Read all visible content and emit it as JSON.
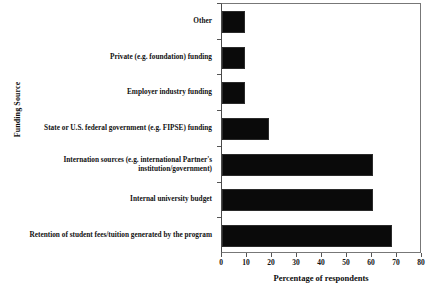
{
  "chart_data": {
    "type": "bar",
    "orientation": "horizontal",
    "title": "",
    "xlabel": "Percentage of respondents",
    "ylabel": "Funding Source",
    "xlim": [
      0,
      80
    ],
    "xticks": [
      0,
      10,
      20,
      30,
      40,
      50,
      60,
      70,
      80
    ],
    "grid": false,
    "legend": null,
    "bar_color": "#0a0a0a",
    "categories": [
      "Other",
      "Private (e.g. foundation) funding",
      "Employer industry funding",
      "State or U.S. federal government (e.g. FIPSE) funding",
      "Internation sources (e.g. international Partner's institution/government)",
      "Internal university budget",
      "Retention of student fees/tuition generated by the program"
    ],
    "values": [
      9.3,
      9.3,
      9.3,
      18.8,
      60.5,
      60.5,
      68.0
    ]
  }
}
